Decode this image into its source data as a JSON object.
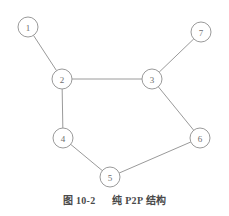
{
  "figure": {
    "caption_number": "图 10-2",
    "caption_title": "纯 P2P 结构",
    "colors": {
      "background": "#ffffff",
      "edge": "#9a9a9a",
      "node_stroke": "#9a9a9a",
      "node_fill": "#ffffff",
      "label_text": "#6e6e6e",
      "caption_text": "#4a4a4a"
    }
  },
  "diagram_data": {
    "type": "node-link-graph",
    "layout": "undirected peer-to-peer mesh",
    "width": 229,
    "height": 216,
    "node_radius": 10,
    "nodes": [
      {
        "id": "1",
        "label": "1",
        "cx": 28,
        "cy": 27
      },
      {
        "id": "2",
        "label": "2",
        "cx": 62,
        "cy": 79
      },
      {
        "id": "3",
        "label": "3",
        "cx": 152,
        "cy": 79
      },
      {
        "id": "4",
        "label": "4",
        "cx": 63,
        "cy": 138
      },
      {
        "id": "5",
        "label": "5",
        "cx": 110,
        "cy": 177
      },
      {
        "id": "6",
        "label": "6",
        "cx": 200,
        "cy": 138
      },
      {
        "id": "7",
        "label": "7",
        "cx": 201,
        "cy": 32
      }
    ],
    "edges": [
      {
        "from": "1",
        "to": "2"
      },
      {
        "from": "2",
        "to": "3"
      },
      {
        "from": "2",
        "to": "4"
      },
      {
        "from": "3",
        "to": "7"
      },
      {
        "from": "3",
        "to": "6"
      },
      {
        "from": "4",
        "to": "5"
      },
      {
        "from": "5",
        "to": "6"
      }
    ]
  }
}
